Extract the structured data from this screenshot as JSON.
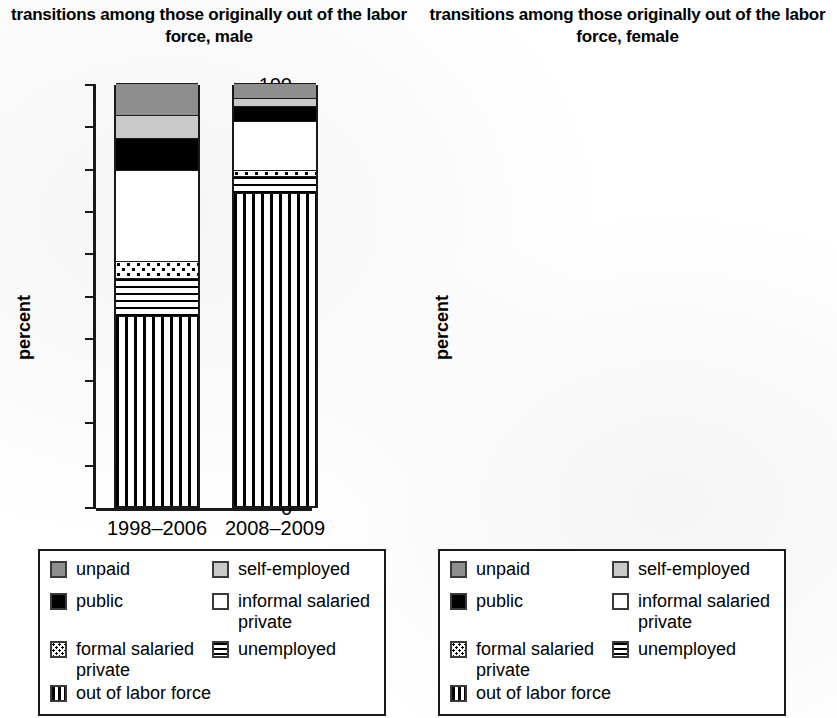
{
  "charts": [
    {
      "id": "male",
      "title": "transitions among those originally out of\nthe labor force, male",
      "ylabel": "percent"
    },
    {
      "id": "female",
      "title": "transitions among those originally out of the\nlabor force, female",
      "ylabel": "percent"
    }
  ],
  "axis": {
    "ticks": [
      "100",
      "90",
      "80",
      "70",
      "60",
      "50",
      "40",
      "30",
      "20",
      "10",
      "0"
    ],
    "categories": [
      "1998–2006",
      "2008–2009"
    ]
  },
  "legend": {
    "items": [
      {
        "key": "unpaid",
        "label": "unpaid",
        "swatch": "unpaid-swatch"
      },
      {
        "key": "self_employed",
        "label": "self-employed",
        "swatch": "self-employed-swatch"
      },
      {
        "key": "public",
        "label": "public",
        "swatch": "public-swatch"
      },
      {
        "key": "informal_salaried",
        "label": "informal salaried\nprivate",
        "swatch": "informal-salaried-private-swatch"
      },
      {
        "key": "formal_salaried",
        "label": "formal salaried\nprivate",
        "swatch": "formal-salaried-private-swatch"
      },
      {
        "key": "unemployed",
        "label": "unemployed",
        "swatch": "unemployed-swatch"
      },
      {
        "key": "out_of_labor_force",
        "label": "out of labor force",
        "swatch": "out-of-labor-force-swatch"
      }
    ]
  },
  "chart_data": [
    {
      "type": "bar",
      "subtype": "stacked-100",
      "title": "transitions among those originally out of the labor force, male",
      "xlabel": "",
      "ylabel": "percent",
      "ylim": [
        0,
        100
      ],
      "yticks": [
        0,
        10,
        20,
        30,
        40,
        50,
        60,
        70,
        80,
        90,
        100
      ],
      "grid": false,
      "legend_position": "below",
      "categories": [
        "1998–2006",
        "2008–2009"
      ],
      "series": [
        {
          "name": "out of labor force",
          "values": [
            45.0,
            74.0
          ]
        },
        {
          "name": "unemployed",
          "values": [
            9.0,
            4.0
          ]
        },
        {
          "name": "formal salaried private",
          "values": [
            4.0,
            1.5
          ]
        },
        {
          "name": "informal salaried private",
          "values": [
            21.5,
            11.5
          ]
        },
        {
          "name": "public",
          "values": [
            7.5,
            3.5
          ]
        },
        {
          "name": "self-employed",
          "values": [
            5.5,
            2.0
          ]
        },
        {
          "name": "unpaid",
          "values": [
            7.5,
            3.5
          ]
        }
      ]
    },
    {
      "type": "bar",
      "subtype": "stacked-100",
      "title": "transitions among those originally out of the labor force, female",
      "xlabel": "",
      "ylabel": "percent",
      "ylim": [
        0,
        100
      ],
      "yticks": [
        0,
        10,
        20,
        30,
        40,
        50,
        60,
        70,
        80,
        90,
        100
      ],
      "grid": false,
      "legend_position": "below",
      "categories": [
        "1998–2006",
        "2008–2009"
      ],
      "series": [
        {
          "name": "out of labor force",
          "values": [
            80.5,
            82.5
          ]
        },
        {
          "name": "unemployed",
          "values": [
            4.0,
            3.0
          ]
        },
        {
          "name": "formal salaried private",
          "values": [
            1.0,
            0.5
          ]
        },
        {
          "name": "informal salaried private",
          "values": [
            2.5,
            1.5
          ]
        },
        {
          "name": "public",
          "values": [
            3.5,
            1.5
          ]
        },
        {
          "name": "self-employed",
          "values": [
            3.0,
            6.0
          ]
        },
        {
          "name": "unpaid",
          "values": [
            5.5,
            5.0
          ]
        }
      ]
    }
  ],
  "colors": {
    "unpaid": "#8e8e8e",
    "self_employed": "#c9c9c9",
    "public": "#000000",
    "informal_salaried": "#ffffff",
    "axis": "#1a1a1a"
  }
}
